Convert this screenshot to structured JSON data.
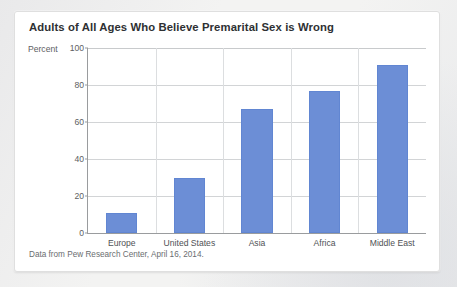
{
  "chart_data": {
    "type": "bar",
    "title": "Adults of All Ages Who Believe Premarital Sex is Wrong",
    "categories": [
      "Europe",
      "United States",
      "Asia",
      "Africa",
      "Middle East"
    ],
    "values": [
      11,
      30,
      67,
      77,
      91
    ],
    "xlabel": "",
    "ylabel": "Percent",
    "ylim": [
      0,
      100
    ],
    "yticks": [
      0,
      20,
      40,
      60,
      80,
      100
    ],
    "grid": true,
    "legend": false,
    "source_note": "Data from Pew Research Center, April 16, 2014.",
    "bar_color": "#6c8ed6",
    "axis_color": "#9a9c9e",
    "grid_color": "#d2d4d6",
    "title_color": "#2e3033",
    "card_background": "#ffffff",
    "page_background": "#f3f3f2"
  }
}
